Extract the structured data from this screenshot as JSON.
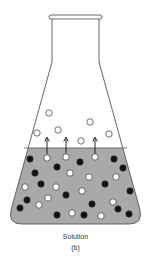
{
  "caption": {
    "label": "Solution",
    "sublabel": "(b)"
  },
  "colors": {
    "outline": "#444444",
    "liquid": "#a9a9a9",
    "solvent_particle": "#ffffff",
    "solute_particle": "#111111"
  },
  "vapor_particles": [
    {
      "kind": "solvent"
    },
    {
      "kind": "solvent"
    },
    {
      "kind": "solvent"
    },
    {
      "kind": "solvent"
    },
    {
      "kind": "solvent"
    },
    {
      "kind": "solvent"
    }
  ],
  "evaporation_arrows": 3,
  "liquid_particles": {
    "solvent_count": 15,
    "solute_count": 16
  }
}
